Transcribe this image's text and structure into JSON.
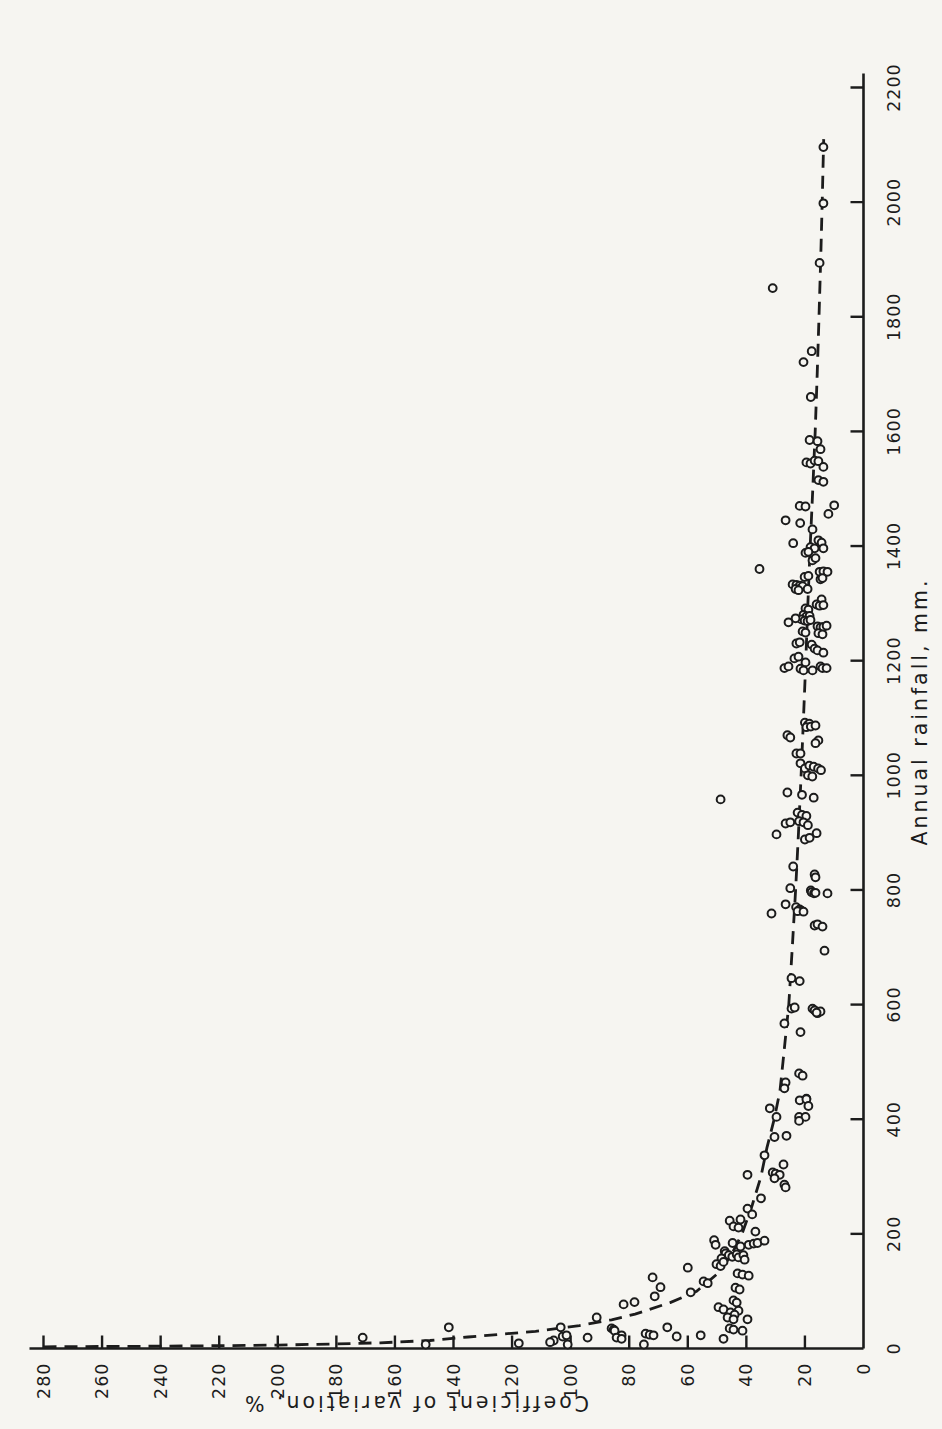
{
  "page": {
    "background": "#f6f5f1",
    "ink": "#1c1c1c"
  },
  "chart_data": {
    "type": "scatter",
    "title": "",
    "xlabel": "Annual rainfall, mm.",
    "ylabel": "Coefficient of variation, %",
    "xlim": [
      0,
      2200
    ],
    "ylim": [
      0,
      280
    ],
    "x_ticks": [
      0,
      200,
      400,
      600,
      800,
      1000,
      1200,
      1400,
      1600,
      1800,
      2000,
      2200
    ],
    "y_ticks": [
      0,
      20,
      40,
      60,
      80,
      100,
      120,
      140,
      160,
      180,
      200,
      220,
      240,
      260,
      280
    ],
    "grid": false,
    "legend": null,
    "orientation": "figure rotated 90 degrees counterclockwise on portrait page",
    "marker": {
      "style": "open-circle",
      "color": "#1c1c1c"
    },
    "trend_curve": {
      "style": "dashed",
      "points": [
        [
          3,
          280
        ],
        [
          4,
          240
        ],
        [
          6,
          200
        ],
        [
          8,
          180
        ],
        [
          10,
          165
        ],
        [
          14,
          148
        ],
        [
          20,
          135
        ],
        [
          30,
          112
        ],
        [
          40,
          97
        ],
        [
          50,
          86
        ],
        [
          60,
          78
        ],
        [
          80,
          66
        ],
        [
          100,
          57
        ],
        [
          130,
          50
        ],
        [
          160,
          45.5
        ],
        [
          200,
          41.5
        ],
        [
          250,
          38
        ],
        [
          300,
          35
        ],
        [
          350,
          33
        ],
        [
          400,
          30.5
        ],
        [
          450,
          28.5
        ],
        [
          500,
          27.5
        ],
        [
          600,
          25.5
        ],
        [
          700,
          24.3
        ],
        [
          800,
          23.2
        ],
        [
          900,
          22.2
        ],
        [
          1000,
          21.3
        ],
        [
          1100,
          20.5
        ],
        [
          1200,
          19.7
        ],
        [
          1300,
          19.0
        ],
        [
          1400,
          18.2
        ],
        [
          1500,
          17.3
        ],
        [
          1600,
          16.5
        ],
        [
          1700,
          15.8
        ],
        [
          1800,
          15.2
        ],
        [
          1900,
          14.6
        ],
        [
          2000,
          14.1
        ],
        [
          2110,
          13.6
        ]
      ]
    },
    "points": [
      [
        2096,
        13.7
      ],
      [
        1998,
        13.7
      ],
      [
        1894,
        15.0
      ],
      [
        1850,
        31.0
      ],
      [
        1740,
        17.7
      ],
      [
        1721,
        20.5
      ],
      [
        1660,
        18.0
      ],
      [
        1585,
        18.4
      ],
      [
        1583,
        15.7
      ],
      [
        1569,
        14.7
      ],
      [
        1546,
        19.5
      ],
      [
        1544,
        18.1
      ],
      [
        1549,
        16.7
      ],
      [
        1548,
        15.4
      ],
      [
        1538,
        13.7
      ],
      [
        1515,
        15.4
      ],
      [
        1512,
        13.7
      ],
      [
        1471,
        10.0
      ],
      [
        1456,
        12.0
      ],
      [
        1470,
        21.8
      ],
      [
        1469,
        19.8
      ],
      [
        1445,
        26.6
      ],
      [
        1440,
        21.6
      ],
      [
        1429,
        17.4
      ],
      [
        1405,
        24.0
      ],
      [
        1398,
        18.1
      ],
      [
        1396,
        16.7
      ],
      [
        1410,
        15.4
      ],
      [
        1406,
        14.3
      ],
      [
        1396,
        13.7
      ],
      [
        1388,
        19.8
      ],
      [
        1390,
        18.8
      ],
      [
        1375,
        17.4
      ],
      [
        1379,
        16.4
      ],
      [
        1360,
        35.5
      ],
      [
        1355,
        15.0
      ],
      [
        1356,
        13.7
      ],
      [
        1355,
        12.3
      ],
      [
        1342,
        14.7
      ],
      [
        1344,
        14.0
      ],
      [
        1346,
        20.1
      ],
      [
        1348,
        18.8
      ],
      [
        1333,
        24.2
      ],
      [
        1332,
        22.9
      ],
      [
        1331,
        21.8
      ],
      [
        1330,
        20.8
      ],
      [
        1325,
        23.2
      ],
      [
        1323,
        22.2
      ],
      [
        1325,
        19.1
      ],
      [
        1307,
        14.3
      ],
      [
        1298,
        16.0
      ],
      [
        1296,
        15.0
      ],
      [
        1297,
        13.7
      ],
      [
        1291,
        19.8
      ],
      [
        1289,
        18.8
      ],
      [
        1280,
        20.5
      ],
      [
        1277,
        19.5
      ],
      [
        1278,
        18.4
      ],
      [
        1272,
        21.2
      ],
      [
        1270,
        20.1
      ],
      [
        1269,
        19.1
      ],
      [
        1271,
        18.1
      ],
      [
        1274,
        23.2
      ],
      [
        1267,
        25.6
      ],
      [
        1251,
        20.8
      ],
      [
        1249,
        19.8
      ],
      [
        1260,
        15.7
      ],
      [
        1258,
        14.7
      ],
      [
        1259,
        13.7
      ],
      [
        1261,
        12.6
      ],
      [
        1248,
        15.4
      ],
      [
        1246,
        14.0
      ],
      [
        1230,
        22.9
      ],
      [
        1232,
        21.8
      ],
      [
        1228,
        17.7
      ],
      [
        1221,
        16.7
      ],
      [
        1218,
        15.7
      ],
      [
        1214,
        13.7
      ],
      [
        1204,
        23.6
      ],
      [
        1207,
        22.2
      ],
      [
        1197,
        19.8
      ],
      [
        1187,
        27.0
      ],
      [
        1190,
        25.6
      ],
      [
        1186,
        21.5
      ],
      [
        1183,
        20.5
      ],
      [
        1190,
        14.7
      ],
      [
        1187,
        14.0
      ],
      [
        1187,
        12.6
      ],
      [
        1183,
        17.4
      ],
      [
        1092,
        20.0
      ],
      [
        1088,
        19.0
      ],
      [
        1090,
        18.5
      ],
      [
        1084,
        19.5
      ],
      [
        1085,
        18.0
      ],
      [
        1087,
        16.4
      ],
      [
        1070,
        26.0
      ],
      [
        1066,
        25.0
      ],
      [
        1061,
        15.4
      ],
      [
        1056,
        16.4
      ],
      [
        1038,
        22.9
      ],
      [
        1038,
        21.5
      ],
      [
        1021,
        21.5
      ],
      [
        1012,
        20.0
      ],
      [
        1017,
        18.5
      ],
      [
        1015,
        17.0
      ],
      [
        1012,
        15.5
      ],
      [
        1009,
        14.5
      ],
      [
        1000,
        19.0
      ],
      [
        998,
        17.5
      ],
      [
        970,
        26.0
      ],
      [
        966,
        21.0
      ],
      [
        961,
        17.0
      ],
      [
        958,
        48.8
      ],
      [
        935,
        22.5
      ],
      [
        931,
        21.0
      ],
      [
        929,
        19.5
      ],
      [
        920,
        22.0
      ],
      [
        918,
        20.5
      ],
      [
        913,
        19.0
      ],
      [
        916,
        26.6
      ],
      [
        918,
        25.0
      ],
      [
        897,
        29.7
      ],
      [
        899,
        16.0
      ],
      [
        888,
        20.0
      ],
      [
        891,
        18.4
      ],
      [
        841,
        24.0
      ],
      [
        827,
        16.7
      ],
      [
        822,
        16.4
      ],
      [
        803,
        25.0
      ],
      [
        775,
        26.6
      ],
      [
        799,
        18.0
      ],
      [
        796,
        17.7
      ],
      [
        794,
        16.9
      ],
      [
        795,
        16.4
      ],
      [
        794,
        12.3
      ],
      [
        770,
        23.0
      ],
      [
        766,
        21.8
      ],
      [
        764,
        21.2
      ],
      [
        763,
        22.5
      ],
      [
        762,
        20.5
      ],
      [
        759,
        31.4
      ],
      [
        738,
        16.7
      ],
      [
        740,
        15.7
      ],
      [
        736,
        14.0
      ],
      [
        694,
        13.3
      ],
      [
        646,
        24.6
      ],
      [
        641,
        21.8
      ],
      [
        593,
        24.6
      ],
      [
        595,
        23.5
      ],
      [
        593,
        17.4
      ],
      [
        590,
        16.7
      ],
      [
        585,
        15.7
      ],
      [
        588,
        14.7
      ],
      [
        586,
        16.0
      ],
      [
        567,
        27.0
      ],
      [
        552,
        21.5
      ],
      [
        480,
        22.0
      ],
      [
        476,
        20.8
      ],
      [
        464,
        26.6
      ],
      [
        436,
        19.5
      ],
      [
        454,
        27.0
      ],
      [
        419,
        32.0
      ],
      [
        404,
        29.7
      ],
      [
        433,
        21.8
      ],
      [
        435,
        19.5
      ],
      [
        423,
        18.8
      ],
      [
        404,
        22.0
      ],
      [
        404,
        19.8
      ],
      [
        397,
        22.0
      ],
      [
        369,
        30.4
      ],
      [
        371,
        26.3
      ],
      [
        337,
        33.8
      ],
      [
        321,
        27.3
      ],
      [
        303,
        39.6
      ],
      [
        307,
        31.0
      ],
      [
        305,
        30.0
      ],
      [
        303,
        28.6
      ],
      [
        297,
        30.4
      ],
      [
        286,
        27.0
      ],
      [
        281,
        26.6
      ],
      [
        262,
        35.0
      ],
      [
        244,
        39.6
      ],
      [
        234,
        38.0
      ],
      [
        225,
        42.0
      ],
      [
        223,
        45.7
      ],
      [
        213,
        44.4
      ],
      [
        211,
        42.7
      ],
      [
        204,
        36.9
      ],
      [
        184,
        44.7
      ],
      [
        181,
        39.2
      ],
      [
        183,
        37.5
      ],
      [
        184,
        36.2
      ],
      [
        188,
        33.8
      ],
      [
        189,
        51.0
      ],
      [
        181,
        50.5
      ],
      [
        170,
        47.4
      ],
      [
        166,
        47.1
      ],
      [
        163,
        46.0
      ],
      [
        160,
        44.8
      ],
      [
        157,
        48.5
      ],
      [
        164,
        43.3
      ],
      [
        159,
        42.7
      ],
      [
        178,
        42.0
      ],
      [
        163,
        41.0
      ],
      [
        155,
        40.6
      ],
      [
        147,
        50.2
      ],
      [
        144,
        48.8
      ],
      [
        151,
        47.8
      ],
      [
        131,
        43.0
      ],
      [
        129,
        41.3
      ],
      [
        127,
        39.2
      ],
      [
        124,
        72.0
      ],
      [
        117,
        54.6
      ],
      [
        114,
        53.2
      ],
      [
        141,
        60.0
      ],
      [
        107,
        69.3
      ],
      [
        106,
        43.7
      ],
      [
        103,
        42.3
      ],
      [
        98,
        59.0
      ],
      [
        91,
        71.3
      ],
      [
        84,
        44.4
      ],
      [
        80,
        43.3
      ],
      [
        77,
        81.9
      ],
      [
        81,
        78.2
      ],
      [
        72,
        49.5
      ],
      [
        68,
        47.8
      ],
      [
        66,
        42.7
      ],
      [
        63,
        45.4
      ],
      [
        59,
        44.0
      ],
      [
        54,
        91.1
      ],
      [
        54,
        46.4
      ],
      [
        51,
        44.4
      ],
      [
        51,
        39.6
      ],
      [
        37,
        141.6
      ],
      [
        37,
        103.4
      ],
      [
        37,
        67.0
      ],
      [
        35,
        86.0
      ],
      [
        33,
        85.3
      ],
      [
        31,
        85.0
      ],
      [
        35,
        45.7
      ],
      [
        33,
        44.4
      ],
      [
        31,
        41.3
      ],
      [
        26,
        74.4
      ],
      [
        24,
        73.0
      ],
      [
        23,
        71.7
      ],
      [
        23,
        82.6
      ],
      [
        21,
        102.7
      ],
      [
        23,
        101.4
      ],
      [
        21,
        63.8
      ],
      [
        19,
        171.0
      ],
      [
        19,
        94.2
      ],
      [
        19,
        84.3
      ],
      [
        17,
        82.6
      ],
      [
        23,
        55.6
      ],
      [
        17,
        47.8
      ],
      [
        14,
        105.8
      ],
      [
        11,
        107.0
      ],
      [
        9,
        117.7
      ],
      [
        7,
        149.5
      ],
      [
        7,
        101.0
      ],
      [
        7,
        75.0
      ]
    ]
  }
}
